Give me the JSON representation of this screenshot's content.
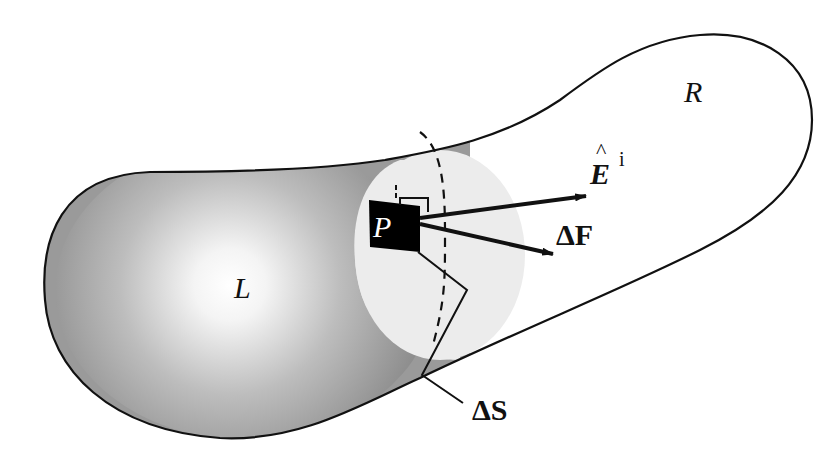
{
  "diagram": {
    "regions": {
      "left": {
        "label": "L"
      },
      "right": {
        "label": "R"
      }
    },
    "point": {
      "label": "P"
    },
    "vectors": {
      "incident_field": {
        "label": "E",
        "hat": "^",
        "superscript": "i"
      },
      "force": {
        "label": "ΔF"
      }
    },
    "surface_element": {
      "label": "ΔS"
    },
    "colors": {
      "outline": "#111111",
      "shading_dark": "#8a8a8a",
      "shading_light": "#ffffff",
      "cap": "#ececec",
      "patch": "#000000"
    }
  }
}
